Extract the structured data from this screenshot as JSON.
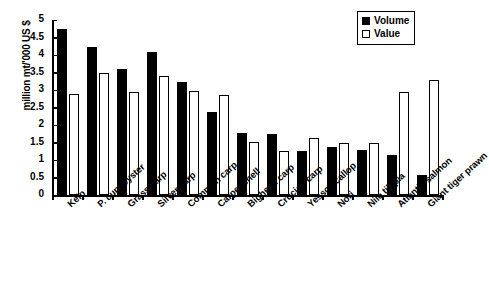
{
  "chart_data": {
    "type": "bar",
    "title": "",
    "xlabel": "",
    "ylabel": "million mt/'000 US $",
    "ylim": [
      0,
      5
    ],
    "ytick_step": 0.5,
    "ytick_labels": [
      "5",
      "4.5",
      "4",
      "3.5",
      "3",
      "2.5",
      "2",
      "1.5",
      "1",
      "0.5",
      "0"
    ],
    "grid": false,
    "legend_position": "top-right",
    "categories": [
      "Kelp",
      "P. cup. oyster",
      "Grass carp",
      "Silver carp",
      "Common carp",
      "Carpet shell",
      "Bighead carp",
      "Crucian carp",
      "Yesso scallop",
      "Nori",
      "Nile tilapia",
      "Atlantic salmon",
      "Giant tiger prawn"
    ],
    "series": [
      {
        "name": "Volume",
        "color": "#000000",
        "values": [
          4.75,
          4.22,
          3.6,
          4.1,
          3.22,
          2.38,
          1.78,
          1.75,
          1.25,
          1.38,
          1.28,
          1.15,
          0.57
        ]
      },
      {
        "name": "Value",
        "color": "#ffffff",
        "values": [
          2.88,
          3.5,
          2.93,
          3.4,
          2.97,
          2.87,
          1.52,
          1.25,
          1.62,
          1.48,
          1.48,
          2.95,
          3.3
        ]
      }
    ]
  },
  "legend": {
    "items": [
      {
        "label": "Volume",
        "swatch": "filled-square-icon"
      },
      {
        "label": "Value",
        "swatch": "hollow-square-icon"
      }
    ]
  }
}
